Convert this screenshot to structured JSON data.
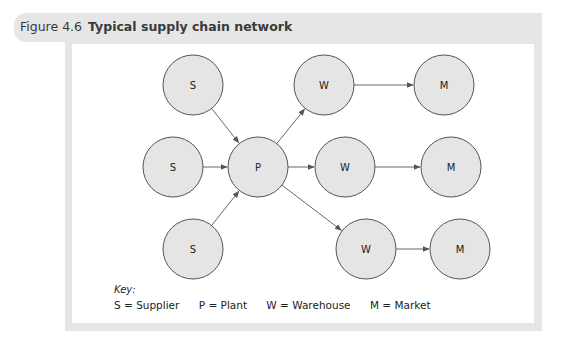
{
  "figure": {
    "number": "Figure 4.6",
    "title": "Typical supply chain network"
  },
  "diagram": {
    "nodes": [
      {
        "id": "s1",
        "label": "S",
        "cx": 193,
        "cy": 85
      },
      {
        "id": "s2",
        "label": "S",
        "cx": 173,
        "cy": 167
      },
      {
        "id": "s3",
        "label": "S",
        "cx": 193,
        "cy": 249
      },
      {
        "id": "p",
        "label": "P",
        "cx": 258,
        "cy": 167
      },
      {
        "id": "w1",
        "label": "W",
        "cx": 324,
        "cy": 85
      },
      {
        "id": "w2",
        "label": "W",
        "cx": 345,
        "cy": 167
      },
      {
        "id": "w3",
        "label": "W",
        "cx": 366,
        "cy": 249
      },
      {
        "id": "m1",
        "label": "M",
        "cx": 444,
        "cy": 85
      },
      {
        "id": "m2",
        "label": "M",
        "cx": 451,
        "cy": 167
      },
      {
        "id": "m3",
        "label": "M",
        "cx": 460,
        "cy": 249
      }
    ],
    "edges": [
      {
        "from": "s1",
        "to": "p"
      },
      {
        "from": "s2",
        "to": "p"
      },
      {
        "from": "s3",
        "to": "p"
      },
      {
        "from": "p",
        "to": "w1"
      },
      {
        "from": "p",
        "to": "w2"
      },
      {
        "from": "p",
        "to": "w3"
      },
      {
        "from": "w1",
        "to": "m1"
      },
      {
        "from": "w2",
        "to": "m2"
      },
      {
        "from": "w3",
        "to": "m3"
      }
    ],
    "node_radius": 30
  },
  "key": {
    "label": "Key:",
    "items": [
      {
        "text": "S = Supplier"
      },
      {
        "text": "P = Plant"
      },
      {
        "text": "W = Warehouse"
      },
      {
        "text": "M = Market"
      }
    ]
  }
}
